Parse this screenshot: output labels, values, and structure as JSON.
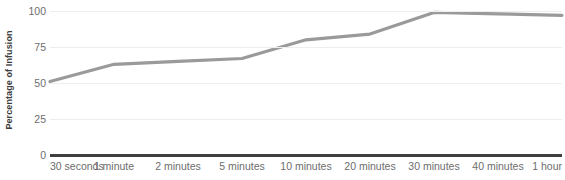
{
  "chart_data": {
    "type": "line",
    "title": "",
    "xlabel": "",
    "ylabel": "Percentage of Infusion",
    "categories": [
      "30 seconds",
      "1 minute",
      "2 minutes",
      "5 minutes",
      "10 minutes",
      "20 minutes",
      "30 minutes",
      "40 minutes",
      "1 hour"
    ],
    "values": [
      51,
      63,
      65,
      67,
      80,
      84,
      99,
      98,
      97
    ],
    "series": [
      {
        "name": "Percentage of Infusion",
        "values": [
          51,
          63,
          65,
          67,
          80,
          84,
          99,
          98,
          97
        ],
        "color": "#9a9a9a"
      }
    ],
    "ylim": [
      0,
      100
    ],
    "yticks": [
      0,
      25,
      50,
      75,
      100
    ],
    "ytick_labels": [
      "0",
      "25",
      "50",
      "75",
      "100"
    ],
    "grid": true,
    "grid_color": "#eeeeee",
    "legend": "none",
    "axis_color": "#3f3f3f",
    "tick_label_color": "#6d6d6d",
    "axis_title_color": "#3b3b3b"
  }
}
